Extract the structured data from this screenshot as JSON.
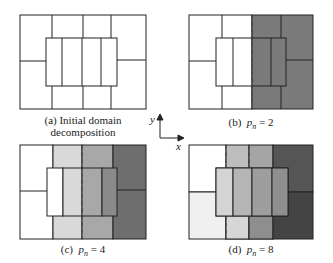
{
  "panels": [
    {
      "id": "a",
      "caption_line1": "(a) Initial domain",
      "caption_line2": "decomposition"
    },
    {
      "id": "b",
      "caption_prefix": "(b)",
      "caption_var": "p",
      "caption_sub": "n",
      "caption_eq": "= 2"
    },
    {
      "id": "c",
      "caption_prefix": "(c)",
      "caption_var": "p",
      "caption_sub": "n",
      "caption_eq": "= 4"
    },
    {
      "id": "d",
      "caption_prefix": "(d)",
      "caption_var": "p",
      "caption_sub": "n",
      "caption_eq": "= 8"
    }
  ],
  "axes": {
    "x_label": "x",
    "y_label": "y"
  },
  "colors": {
    "white": "#ffffff",
    "light": "#d9d9d9",
    "mid": "#a8a8a8",
    "midDark": "#8a8a8a",
    "dark": "#6e6e6e",
    "darker": "#555555",
    "darkest": "#444444"
  }
}
